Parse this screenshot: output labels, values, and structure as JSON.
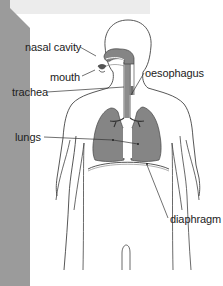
{
  "diagram": {
    "type": "anatomy-labeled-diagram",
    "labels": [
      {
        "id": "nasal-cavity",
        "text": "nasal cavity",
        "x": 25,
        "y": 40
      },
      {
        "id": "mouth",
        "text": "mouth",
        "x": 50,
        "y": 71
      },
      {
        "id": "oesophagus",
        "text": "oesophagus",
        "x": 145,
        "y": 66
      },
      {
        "id": "trachea",
        "text": "trachea",
        "x": 12,
        "y": 86
      },
      {
        "id": "lungs",
        "text": "lungs",
        "x": 15,
        "y": 131
      },
      {
        "id": "diaphragm",
        "text": "diaphragm",
        "x": 170,
        "y": 212
      }
    ],
    "colors": {
      "side_band": "#9b9b9b",
      "top_band": "#ececec",
      "organ_fill": "#858585",
      "outline": "#444444",
      "background": "#ffffff"
    }
  }
}
